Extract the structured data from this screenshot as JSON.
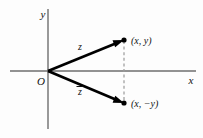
{
  "figure": {
    "name": "complex-plane-conjugate-diagram",
    "background_color": "#fdfdfd",
    "axes": {
      "x_label": "x",
      "y_label": "y",
      "origin_label": "O",
      "axis_color": "#6e6e6e"
    },
    "vectors": [
      {
        "name": "z-vector",
        "label": "z",
        "from": [
          48,
          71
        ],
        "to": [
          124,
          40
        ],
        "color": "#000000"
      },
      {
        "name": "z-conjugate-vector",
        "label": "z",
        "label_has_overbar": true,
        "from": [
          48,
          71
        ],
        "to": [
          124,
          103
        ],
        "color": "#000000"
      }
    ],
    "points": [
      {
        "name": "point-z",
        "label": "(x, y)",
        "at": [
          124,
          40
        ]
      },
      {
        "name": "point-z-conjugate",
        "label": "(x, −y)",
        "at": [
          124,
          103
        ]
      }
    ],
    "connector": {
      "name": "vertical-dashed-connector",
      "style": "dashed",
      "color": "#9a9a9a"
    }
  }
}
